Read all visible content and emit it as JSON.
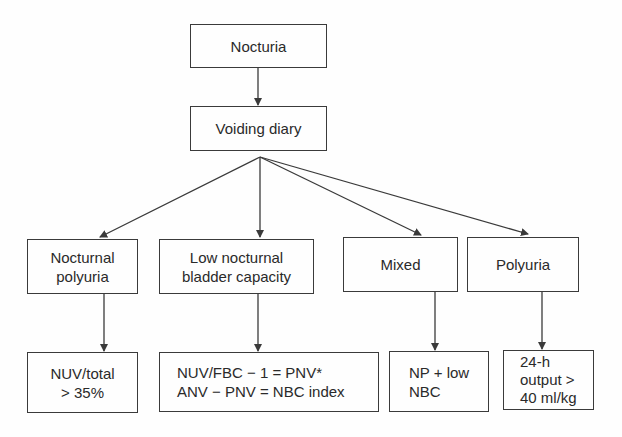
{
  "diagram": {
    "type": "flowchart",
    "root": {
      "id": "nocturia",
      "lines": [
        "Nocturia"
      ]
    },
    "step": {
      "id": "voiding-diary",
      "lines": [
        "Voiding diary"
      ]
    },
    "categories": [
      {
        "id": "nocturnal-polyuria",
        "lines": [
          "Nocturnal",
          "polyuria"
        ],
        "criterion": {
          "lines": [
            "NUV/total",
            "> 35%"
          ]
        }
      },
      {
        "id": "low-nocturnal-bladder-capacity",
        "lines": [
          "Low nocturnal",
          "bladder capacity"
        ],
        "criterion": {
          "lines": [
            "NUV/FBC − 1 = PNV*",
            "ANV − PNV = NBC index"
          ]
        }
      },
      {
        "id": "mixed",
        "lines": [
          "Mixed"
        ],
        "criterion": {
          "lines": [
            "NP + low",
            "NBC"
          ]
        }
      },
      {
        "id": "polyuria",
        "lines": [
          "Polyuria"
        ],
        "criterion": {
          "lines": [
            "24-h",
            "output >",
            "40 ml/kg"
          ]
        }
      }
    ],
    "edges": [
      [
        "Nocturia",
        "Voiding diary"
      ],
      [
        "Voiding diary",
        "Nocturnal polyuria"
      ],
      [
        "Voiding diary",
        "Low nocturnal bladder capacity"
      ],
      [
        "Voiding diary",
        "Mixed"
      ],
      [
        "Voiding diary",
        "Polyuria"
      ],
      [
        "Nocturnal polyuria",
        "NUV/total > 35%"
      ],
      [
        "Low nocturnal bladder capacity",
        "NUV/FBC − 1 = PNV*; ANV − PNV = NBC index"
      ],
      [
        "Mixed",
        "NP + low NBC"
      ],
      [
        "Polyuria",
        "24-h output > 40 ml/kg"
      ]
    ],
    "colors": {
      "stroke": "#3a3a3a",
      "text": "#2a2a2a",
      "background": "#fefefe"
    }
  }
}
